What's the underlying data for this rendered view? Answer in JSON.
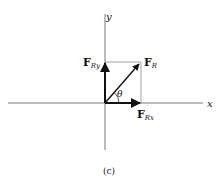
{
  "figure": {
    "caption": "(c)",
    "axes": {
      "x_label": "x",
      "y_label": "y"
    },
    "vectors": {
      "resultant": {
        "symbol": "F",
        "subscript": "R"
      },
      "x_component": {
        "symbol": "F",
        "subscript": "Rx"
      },
      "y_component": {
        "symbol": "F",
        "subscript": "Ry"
      }
    },
    "angle_label": "θ",
    "colors": {
      "line": "#111111",
      "thin_line": "#555555",
      "background": "#ffffff"
    }
  }
}
